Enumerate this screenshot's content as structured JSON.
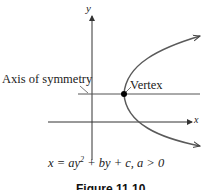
{
  "diagram": {
    "axes": {
      "x_label": "x",
      "y_label": "y"
    },
    "labels": {
      "axis_of_symmetry": "Axis of symmetry",
      "vertex": "Vertex"
    },
    "equation": {
      "prefix": "x = ay",
      "exponent": "2",
      "suffix": " + by + c, a > 0"
    },
    "caption": "Figure 11.10",
    "colors": {
      "curve": "#5a5a5a",
      "axes": "#333333",
      "vertex_dot": "#000000"
    }
  }
}
